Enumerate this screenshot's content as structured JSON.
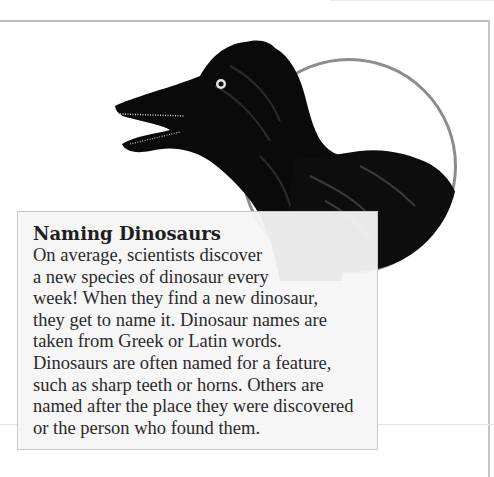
{
  "page": {
    "colors": {
      "background": "#ffffff",
      "frame_rule": "#bdbdbd",
      "circle_border": "#8c8c8c",
      "textbox_bg": "#f5f5f5",
      "textbox_border": "#c9c9c9",
      "text": "#2a2a2a",
      "dinosaur": "#0a0a0a"
    }
  },
  "illustration": {
    "subject": "feathered-dinosaur-head",
    "icon": "dinosaur-illustration"
  },
  "sidebar_box": {
    "title": "Naming Dinosaurs",
    "lines": [
      "On average, scientists discover",
      "a new species of dinosaur every",
      "week! When they find a new dinosaur,",
      "they get to name it. Dinosaur names are",
      "taken from Greek or Latin words.",
      "Dinosaurs are often named for a feature,",
      "such as sharp teeth or horns. Others are",
      "named after the place they were discovered",
      "or the person who found them."
    ]
  }
}
